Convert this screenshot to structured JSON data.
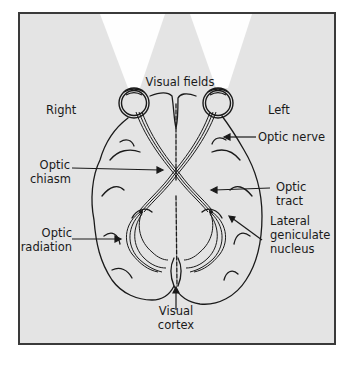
{
  "diagram": {
    "colors": {
      "background": "#e4e4e4",
      "frame_border": "#3a3a3a",
      "visual_field_beam": "#ffffff",
      "ink": "#1a1a1a"
    },
    "labels": {
      "visual_fields": "Visual fields",
      "right": "Right",
      "left": "Left",
      "optic_nerve": "Optic nerve",
      "optic_chiasm": [
        "Optic",
        "chiasm"
      ],
      "optic_tract": [
        "Optic",
        "tract"
      ],
      "optic_radiation": [
        "Optic",
        "radiation"
      ],
      "lateral_geniculate_nucleus": [
        "Lateral",
        "geniculate",
        "nucleus"
      ],
      "visual_cortex": [
        "Visual",
        "cortex"
      ]
    }
  }
}
